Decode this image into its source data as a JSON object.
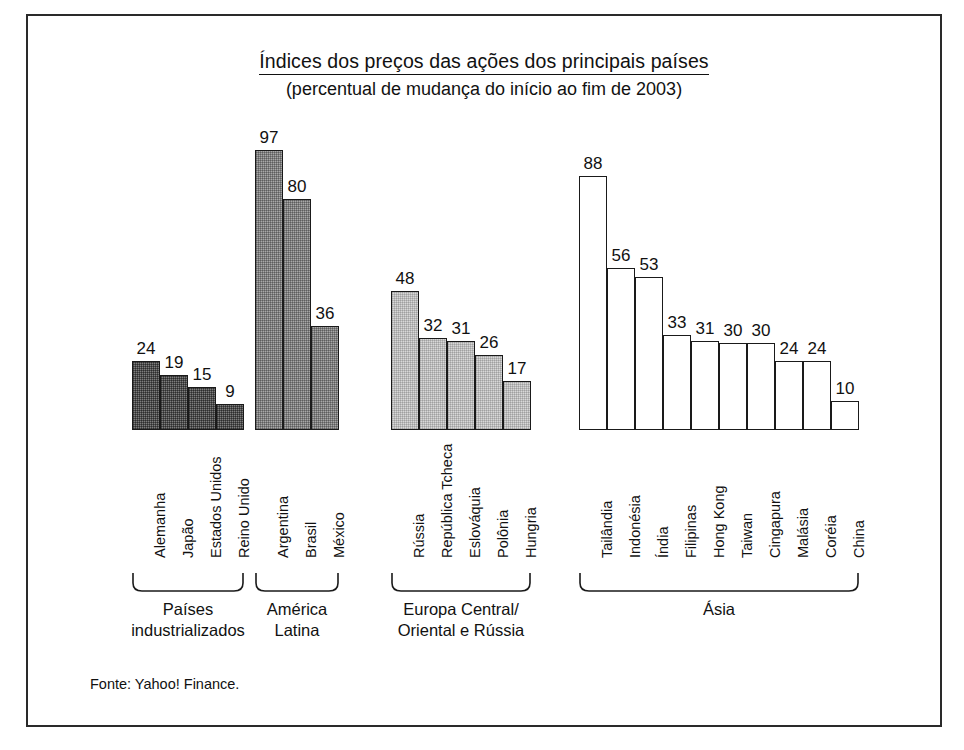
{
  "chart_data": {
    "type": "bar",
    "title": "Índices dos preços das ações dos principais países",
    "subtitle": "(percentual de mudança do início ao fim de 2003)",
    "xlabel": "",
    "ylabel": "",
    "ylim": [
      0,
      97
    ],
    "grid": false,
    "legend": "none",
    "value_suffix": "",
    "source": "Fonte: Yahoo! Finance.",
    "groups": [
      {
        "name": "Países industrializados",
        "caption_lines": [
          "Países",
          "industrializados"
        ],
        "fill": "dark",
        "fill_hex": "#7e7e7e",
        "categories": [
          "Alemanha",
          "Japão",
          "Estados Unidos",
          "Reino Unido"
        ],
        "values": [
          24,
          19,
          15,
          9
        ]
      },
      {
        "name": "América Latina",
        "caption_lines": [
          "América",
          "Latina"
        ],
        "fill": "mid",
        "fill_hex": "#a8a8a8",
        "categories": [
          "Argentina",
          "Brasil",
          "México"
        ],
        "values": [
          97,
          80,
          36
        ]
      },
      {
        "name": "Europa Central/Oriental e Rússia",
        "caption_lines": [
          "Europa Central/",
          "Oriental e Rússia"
        ],
        "fill": "light",
        "fill_hex": "#d8d8d8",
        "categories": [
          "Rússia",
          "República Tcheca",
          "Eslováquia",
          "Polônia",
          "Hungria"
        ],
        "values": [
          48,
          32,
          31,
          26,
          17
        ]
      },
      {
        "name": "Ásia",
        "caption_lines": [
          "Ásia"
        ],
        "fill": "white",
        "fill_hex": "#ffffff",
        "categories": [
          "Tailândia",
          "Indonésia",
          "Índia",
          "Filipinas",
          "Hong Kong",
          "Taiwan",
          "Cingapura",
          "Malásia",
          "Coréia",
          "China"
        ],
        "values": [
          88,
          56,
          53,
          33,
          31,
          30,
          30,
          24,
          24,
          10
        ]
      }
    ]
  }
}
